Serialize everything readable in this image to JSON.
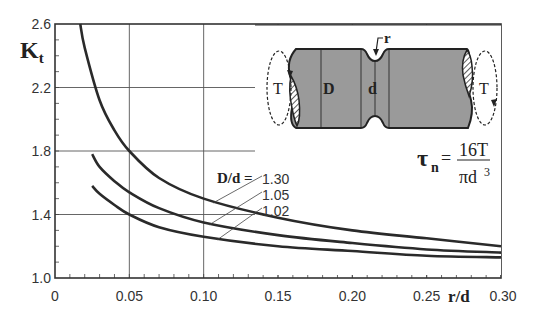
{
  "chart_data": {
    "type": "line",
    "title": "",
    "xlabel": "r/d",
    "ylabel": "Kt",
    "xlim": [
      0,
      0.3
    ],
    "ylim": [
      1.0,
      2.6
    ],
    "grid": true,
    "x_ticks": [
      "0",
      "0.05",
      "0.10",
      "0.15",
      "0.20",
      "0.25",
      "0.30"
    ],
    "y_ticks": [
      "1.0",
      "1.4",
      "1.8",
      "2.2",
      "2.6"
    ],
    "legend_title": "D/d =",
    "series": [
      {
        "name": "1.30",
        "x": [
          0.017,
          0.02,
          0.03,
          0.04,
          0.05,
          0.07,
          0.1,
          0.15,
          0.2,
          0.25,
          0.3
        ],
        "values": [
          2.6,
          2.45,
          2.12,
          1.93,
          1.8,
          1.63,
          1.5,
          1.38,
          1.3,
          1.25,
          1.2
        ]
      },
      {
        "name": "1.05",
        "x": [
          0.025,
          0.03,
          0.04,
          0.05,
          0.07,
          0.1,
          0.15,
          0.2,
          0.25,
          0.3
        ],
        "values": [
          1.78,
          1.7,
          1.61,
          1.54,
          1.44,
          1.35,
          1.27,
          1.22,
          1.18,
          1.16
        ]
      },
      {
        "name": "1.02",
        "x": [
          0.025,
          0.03,
          0.04,
          0.05,
          0.07,
          0.1,
          0.15,
          0.2,
          0.25,
          0.3
        ],
        "values": [
          1.58,
          1.53,
          1.46,
          1.4,
          1.32,
          1.26,
          1.2,
          1.17,
          1.14,
          1.13
        ]
      }
    ],
    "annotations": {
      "formula_lhs": "τ",
      "formula_sub": "n",
      "formula_eq": "=",
      "formula_num": "16T",
      "formula_den": "πd",
      "formula_den_exp": "3",
      "diagram_labels": {
        "torque_left": "T",
        "torque_right": "T",
        "major_diameter": "D",
        "minor_diameter": "d",
        "radius": "r"
      }
    }
  }
}
